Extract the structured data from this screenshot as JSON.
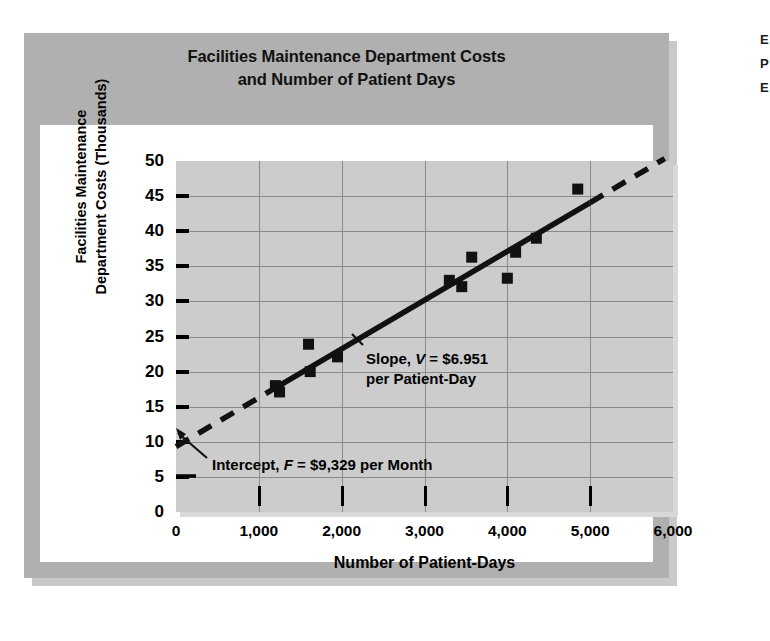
{
  "chart_data": {
    "type": "scatter",
    "title": "Facilities Maintenance Department Costs and Number of Patient Days",
    "title_line1": "Facilities Maintenance Department Costs",
    "title_line2": "and Number of Patient Days",
    "xlabel": "Number of Patient-Days",
    "ylabel": "Facilities Maintenance Department Costs (Thousands)",
    "ylabel_line1": "Facilities Maintenance",
    "ylabel_line2": "Department Costs (Thousands)",
    "xlim": [
      0,
      6000
    ],
    "ylim": [
      0,
      50
    ],
    "xticks": [
      0,
      1000,
      2000,
      3000,
      4000,
      5000,
      6000
    ],
    "xtick_labels": [
      "0",
      "1,000",
      "2,000",
      "3,000",
      "4,000",
      "5,000",
      "6,000"
    ],
    "yticks": [
      0,
      5,
      10,
      15,
      20,
      25,
      30,
      35,
      40,
      45,
      50
    ],
    "ytick_labels": [
      "0",
      "5",
      "10",
      "15",
      "20",
      "25",
      "30",
      "35",
      "40",
      "45",
      "50"
    ],
    "grid": true,
    "legend": "none",
    "points": [
      {
        "x": 1200,
        "y": 18.0
      },
      {
        "x": 1250,
        "y": 17.1
      },
      {
        "x": 1600,
        "y": 23.9
      },
      {
        "x": 1620,
        "y": 20.0
      },
      {
        "x": 1950,
        "y": 22.1
      },
      {
        "x": 3300,
        "y": 33.0
      },
      {
        "x": 3450,
        "y": 32.1
      },
      {
        "x": 3570,
        "y": 36.3
      },
      {
        "x": 4000,
        "y": 33.3
      },
      {
        "x": 4100,
        "y": 37.0
      },
      {
        "x": 4350,
        "y": 39.0
      },
      {
        "x": 4850,
        "y": 46.0
      }
    ],
    "regression": {
      "intercept": 9.329,
      "slope_per_unit": 0.006951,
      "solid_segment_x": [
        1150,
        5000
      ],
      "dashed_segments_x": [
        [
          0,
          1150
        ],
        [
          5000,
          5900
        ]
      ]
    },
    "annotations": [
      {
        "name": "slope",
        "prefix": "Slope, ",
        "variable": "V",
        "suffix": " = $6.951",
        "line2": "per Patient-Day",
        "value": "$6.951 per Patient-Day"
      },
      {
        "name": "intercept",
        "prefix": "Intercept, ",
        "variable": "F",
        "suffix": " = $9,329 per Month",
        "value": "$9,329 per Month"
      }
    ],
    "colors": {
      "panel_background": "#cccccc",
      "frame_background": "#b0b0b0",
      "card_background": "#ffffff",
      "gridline": "#8a8a8a",
      "marker": "#111111",
      "trendline": "#111111",
      "text": "#000000"
    }
  },
  "margin_note": {
    "line1": "E",
    "line2": "P",
    "line3": "E"
  }
}
